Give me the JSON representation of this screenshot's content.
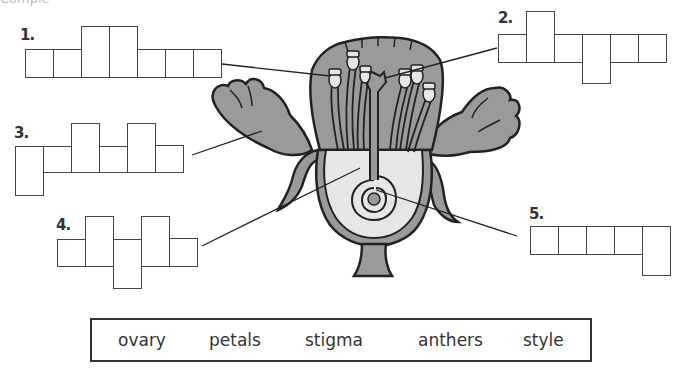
{
  "worksheet": {
    "instructions_fragment": "Comple"
  },
  "puzzles": [
    {
      "number": "1.",
      "letters": 7,
      "label_target": "anthers"
    },
    {
      "number": "2.",
      "letters": 6,
      "label_target": "stigma"
    },
    {
      "number": "3.",
      "letters": 6,
      "label_target": "petals"
    },
    {
      "number": "4.",
      "letters": 5,
      "label_target": "style"
    },
    {
      "number": "5.",
      "letters": 5,
      "label_target": "ovary"
    }
  ],
  "word_bank": {
    "words": [
      "ovary",
      "petals",
      "stigma",
      "anthers",
      "style"
    ]
  },
  "colors": {
    "petal_fill": "#9a9a9a",
    "ovary_fill": "#e6e6e6",
    "outline": "#222222"
  }
}
